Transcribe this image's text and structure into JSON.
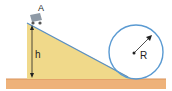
{
  "diagram": {
    "labels": {
      "cart": "A",
      "height": "h",
      "radius": "R"
    },
    "colors": {
      "ground": "#eeb27a",
      "ground_top": "#d9935a",
      "incline_fill": "#f0d98a",
      "incline_edge": "#5a8fc4",
      "loop": "#5a9ad2",
      "cart": "#8f9aa6",
      "arrow": "#222222"
    }
  }
}
